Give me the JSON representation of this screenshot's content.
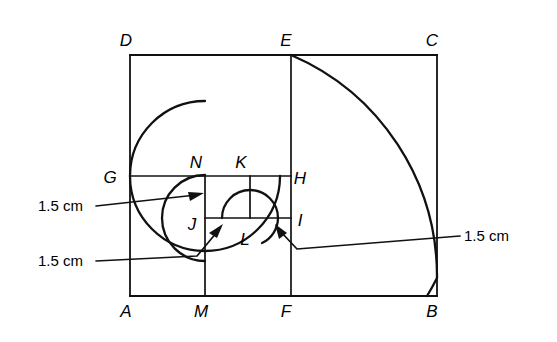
{
  "figure": {
    "type": "geometric-diagram",
    "stroke_color": "#111111",
    "background_color": "#ffffff",
    "vertex_labels": [
      {
        "id": "D",
        "text": "D",
        "x": 126,
        "y": 46
      },
      {
        "id": "E",
        "text": "E",
        "x": 286,
        "y": 46
      },
      {
        "id": "C",
        "text": "C",
        "x": 432,
        "y": 46
      },
      {
        "id": "G",
        "text": "G",
        "x": 110,
        "y": 183
      },
      {
        "id": "N",
        "text": "N",
        "x": 196,
        "y": 168
      },
      {
        "id": "K",
        "text": "K",
        "x": 241,
        "y": 168
      },
      {
        "id": "H",
        "text": "H",
        "x": 296,
        "y": 183
      },
      {
        "id": "J",
        "text": "J",
        "x": 192,
        "y": 228
      },
      {
        "id": "I",
        "text": "I",
        "x": 297,
        "y": 225
      },
      {
        "id": "L",
        "text": "L",
        "x": 244,
        "y": 243
      },
      {
        "id": "A",
        "text": "A",
        "x": 126,
        "y": 314
      },
      {
        "id": "M",
        "text": "M",
        "x": 199,
        "y": 314
      },
      {
        "id": "F",
        "text": "F",
        "x": 286,
        "y": 314
      },
      {
        "id": "B",
        "text": "B",
        "x": 432,
        "y": 314
      }
    ],
    "dimension_labels": [
      {
        "id": "dim-left-upper",
        "text": "1.5 cm",
        "x": 38,
        "y": 211,
        "anchor": "start"
      },
      {
        "id": "dim-left-lower",
        "text": "1.5 cm",
        "x": 38,
        "y": 266,
        "anchor": "start"
      },
      {
        "id": "dim-right",
        "text": "1.5 cm",
        "x": 464,
        "y": 241,
        "anchor": "start"
      }
    ],
    "geometry": {
      "outer_rect": {
        "left": 130,
        "top": 55,
        "right": 437,
        "bottom": 296
      },
      "line_EF": {
        "x": 291,
        "y1": 55,
        "y2": 296
      },
      "line_GH": {
        "y": 176,
        "x1": 130,
        "x2": 291
      },
      "line_NM": {
        "x": 205,
        "y1": 176,
        "y2": 296
      },
      "line_JI": {
        "y": 218,
        "x1": 205,
        "x2": 291
      },
      "line_KL": {
        "x": 250,
        "y1": 176,
        "y2": 218
      },
      "arcs": [
        {
          "id": "arc-E-to-B",
          "center_x": 291,
          "center_y": 296,
          "radius": 241
        },
        {
          "id": "arc-G-to-M",
          "center_x": 205,
          "center_y": 176,
          "radius": 75
        },
        {
          "id": "arc-N-to-I",
          "center_x": 205,
          "center_y": 218,
          "radius": 43
        },
        {
          "id": "arc-J-to-L",
          "center_x": 250,
          "center_y": 218,
          "radius": 28
        }
      ]
    }
  }
}
